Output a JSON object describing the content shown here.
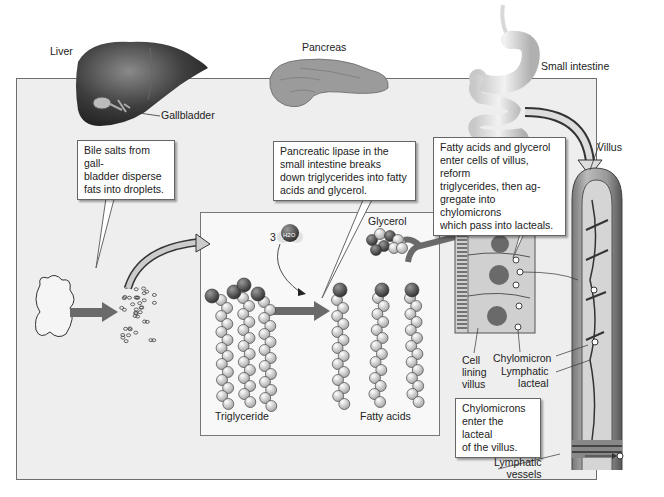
{
  "organs": {
    "liver": "Liver",
    "gallbladder": "Gallbladder",
    "pancreas": "Pancreas",
    "small_intestine": "Small intestine",
    "villus": "Villus"
  },
  "callouts": {
    "bile": [
      "Bile salts from gall-",
      "bladder disperse",
      "fats into droplets."
    ],
    "lipase": [
      "Pancreatic lipase in the",
      "small intestine breaks",
      "down triglycerides into fatty",
      "acids and glycerol."
    ],
    "absorb": [
      "Fatty acids and glycerol",
      "enter cells of villus, reform",
      "triglycerides, then ag-",
      "gregate into chylomicrons",
      "which pass into lacteals."
    ],
    "lacteal": [
      "Chylomicrons",
      "enter the lacteal",
      "of the villus."
    ]
  },
  "molecules": {
    "water_count": "3",
    "water_formula": "H2O",
    "glycerol": "Glycerol",
    "triglyceride": "Triglyceride",
    "fatty_acids": "Fatty acids"
  },
  "cell_labels": {
    "cell_lining": [
      "Cell",
      "lining",
      "villus"
    ],
    "chylomicron": "Chylomicron",
    "lymphatic_lacteal": [
      "Lymphatic",
      "lacteal"
    ],
    "lymphatic_vessels": [
      "Lymphatic",
      "vessels"
    ]
  },
  "colors": {
    "background": "#eeeeee",
    "panel": "#f8f8f8",
    "arrow": "#6a6a6a",
    "dark_sphere": "#4a4a4a",
    "light_sphere": "#d8d8d8"
  }
}
